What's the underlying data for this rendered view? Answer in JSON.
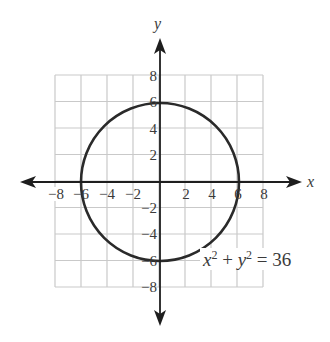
{
  "chart_data": {
    "type": "line",
    "title": "",
    "xlabel": "x",
    "ylabel": "y",
    "xlim": [
      -8,
      8
    ],
    "ylim": [
      -8,
      8
    ],
    "grid": true,
    "grid_step": 2,
    "x_ticks": [
      -8,
      -6,
      -4,
      -2,
      2,
      4,
      6,
      8
    ],
    "y_ticks": [
      8,
      6,
      4,
      2,
      -2,
      -4,
      -6,
      -8
    ],
    "x_tick_labels": [
      "−8",
      "−6",
      "−4",
      "−2",
      "2",
      "4",
      "6",
      "8"
    ],
    "y_tick_labels": [
      "8",
      "6",
      "4",
      "2",
      "−2",
      "−4",
      "−6",
      "−8"
    ],
    "series": [
      {
        "name": "x^2 + y^2 = 36",
        "shape": "circle",
        "center": [
          0,
          0
        ],
        "radius": 6,
        "key_points": [
          [
            6,
            0
          ],
          [
            0,
            6
          ],
          [
            -6,
            0
          ],
          [
            0,
            -6
          ]
        ]
      }
    ],
    "annotations": [
      {
        "text": "x² + y² = 36",
        "position": [
          4.2,
          -5.9
        ]
      }
    ]
  },
  "labels": {
    "x_axis": "x",
    "y_axis": "y",
    "equation": {
      "x": "x",
      "exp1": "2",
      "plus": " + ",
      "y": "y",
      "exp2": "2",
      "rest": " = 36"
    }
  },
  "colors": {
    "grid": "#c9c9c9",
    "axis": "#1e1e1e",
    "curve": "#2a2a2a",
    "text": "#3a3a3a"
  }
}
